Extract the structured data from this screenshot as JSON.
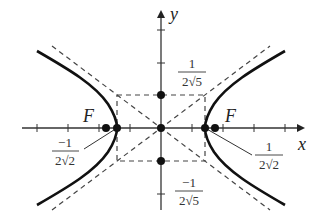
{
  "diagram": {
    "type": "hyperbola",
    "axes": {
      "x_label": "x",
      "y_label": "y"
    },
    "focus_label": "F",
    "labels": {
      "vertex_left": {
        "num": "−1",
        "den": "2√2"
      },
      "vertex_right": {
        "num": "1",
        "den": "2√2"
      },
      "co_vertex_top": {
        "num": "1",
        "den": "2√5"
      },
      "co_vertex_bottom": {
        "num": "−1",
        "den": "2√5"
      }
    },
    "colors": {
      "curve": "#111111",
      "axis": "#333333",
      "dashed": "#444444",
      "text": "#222222"
    }
  }
}
